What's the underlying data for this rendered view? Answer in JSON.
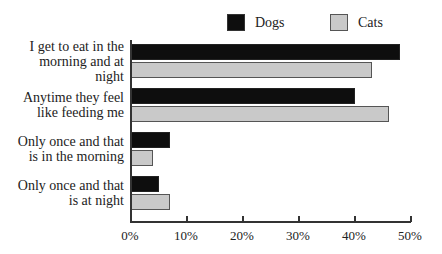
{
  "legend": {
    "dogs": {
      "label": "Dogs",
      "color": "#0e0e0e"
    },
    "cats": {
      "label": "Cats",
      "color": "#c9c9c9"
    }
  },
  "chart_data": {
    "type": "bar",
    "orientation": "horizontal",
    "title": "",
    "xlabel": "",
    "ylabel": "",
    "xlim": [
      0,
      50
    ],
    "x_ticks": [
      "0%",
      "10%",
      "20%",
      "30%",
      "40%",
      "50%"
    ],
    "categories": [
      "I get to eat in the morning and at night",
      "Anytime they feel like feeding me",
      "Only once and that is in the morning",
      "Only once and that is at night"
    ],
    "series": [
      {
        "name": "Dogs",
        "values": [
          48,
          40,
          7,
          5
        ]
      },
      {
        "name": "Cats",
        "values": [
          43,
          46,
          4,
          7
        ]
      }
    ],
    "legend_position": "top-right",
    "grid": false
  },
  "labels": [
    [
      "I get to eat in the",
      "morning and at",
      "night"
    ],
    [
      "Anytime they feel",
      "like feeding me"
    ],
    [
      "Only once and that",
      "is in the morning"
    ],
    [
      "Only once and that",
      "is at night"
    ]
  ]
}
